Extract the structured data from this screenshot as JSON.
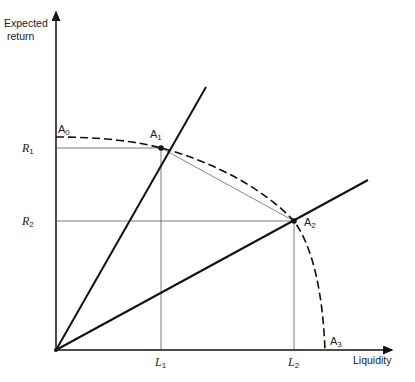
{
  "diagram": {
    "type": "economics-frontier",
    "axes": {
      "y_label_line1": "Expected",
      "y_label_line2": "return",
      "x_label": "Liquidity"
    },
    "points": [
      {
        "id": "A0",
        "base": "A",
        "sub": "0",
        "liquidity": 0,
        "return": 1.0
      },
      {
        "id": "A1",
        "base": "A",
        "sub": "1",
        "liquidity": 0.39,
        "return": 0.94
      },
      {
        "id": "A2",
        "base": "A",
        "sub": "2",
        "liquidity": 0.89,
        "return": 0.6
      },
      {
        "id": "A3",
        "base": "A",
        "sub": "3",
        "liquidity": 1.0,
        "return": 0
      }
    ],
    "y_ticks": [
      {
        "base": "R",
        "sub": "1",
        "point": "A1"
      },
      {
        "base": "R",
        "sub": "2",
        "point": "A2"
      }
    ],
    "x_ticks": [
      {
        "base": "L",
        "sub": "1",
        "point": "A1"
      },
      {
        "base": "L",
        "sub": "2",
        "point": "A2"
      }
    ],
    "rays": [
      {
        "name": "ray-through-A1",
        "through": "A1"
      },
      {
        "name": "ray-through-A2",
        "through": "A2"
      }
    ],
    "chord": {
      "from": "A1",
      "to": "A2"
    },
    "curve": {
      "style": "dashed",
      "from": "A0",
      "to": "A3"
    }
  }
}
